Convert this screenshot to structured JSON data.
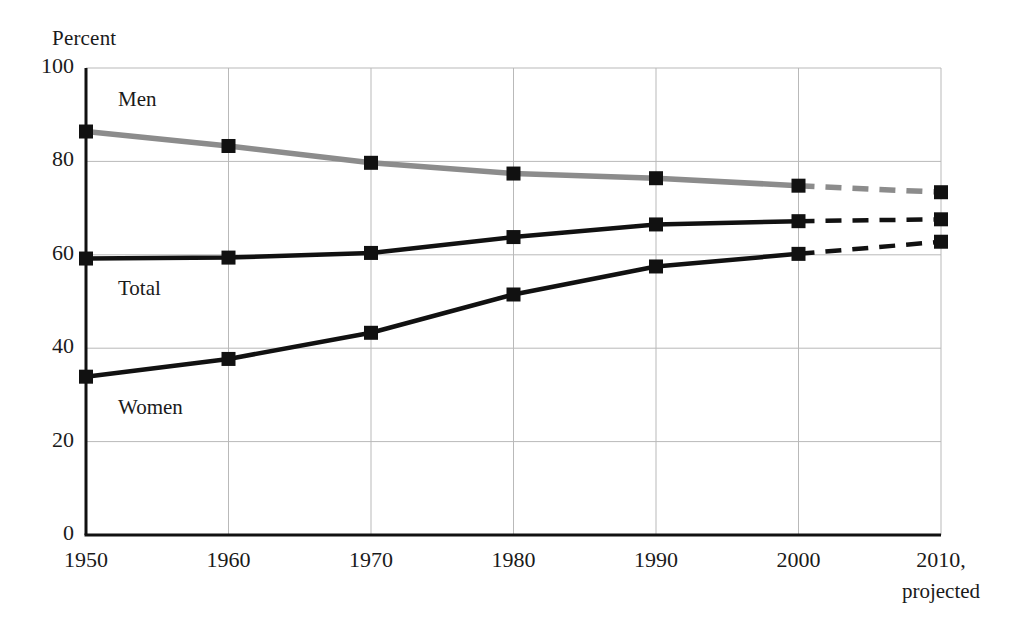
{
  "chart_data": {
    "type": "line",
    "title": "",
    "ylabel": "Percent",
    "xlabel": "",
    "x": [
      1950,
      1960,
      1970,
      1980,
      1990,
      2000,
      2010
    ],
    "xtick_labels": [
      "1950",
      "1960",
      "1970",
      "1980",
      "1990",
      "2000",
      "2010,"
    ],
    "xlim": [
      1950,
      2010
    ],
    "ylim": [
      0,
      100
    ],
    "ytick_labels": [
      "100",
      "80",
      "60",
      "40",
      "20",
      "0"
    ],
    "yticks": [
      100,
      80,
      60,
      40,
      20,
      0
    ],
    "grid": true,
    "legend_position": "inline-labels",
    "projection_note": "projected",
    "projection_starts_at": 2000,
    "series": [
      {
        "name": "Men",
        "color": "#8c8c8c",
        "values": [
          86.4,
          83.3,
          79.7,
          77.4,
          76.4,
          74.8,
          73.4
        ]
      },
      {
        "name": "Total",
        "color": "#111111",
        "values": [
          59.2,
          59.4,
          60.4,
          63.8,
          66.5,
          67.2,
          67.6
        ]
      },
      {
        "name": "Women",
        "color": "#111111",
        "values": [
          33.9,
          37.7,
          43.3,
          51.5,
          57.5,
          60.2,
          62.8
        ]
      }
    ],
    "annotations": [
      {
        "text": "Men",
        "x": 1950,
        "y": 93
      },
      {
        "text": "Total",
        "x": 1950,
        "y": 52.5
      },
      {
        "text": "Women",
        "x": 1950,
        "y": 27
      }
    ]
  },
  "style": {
    "axis_color": "#111111",
    "grid_color": "#b9b9b9",
    "marker_color": "#111111",
    "background": "#ffffff"
  }
}
